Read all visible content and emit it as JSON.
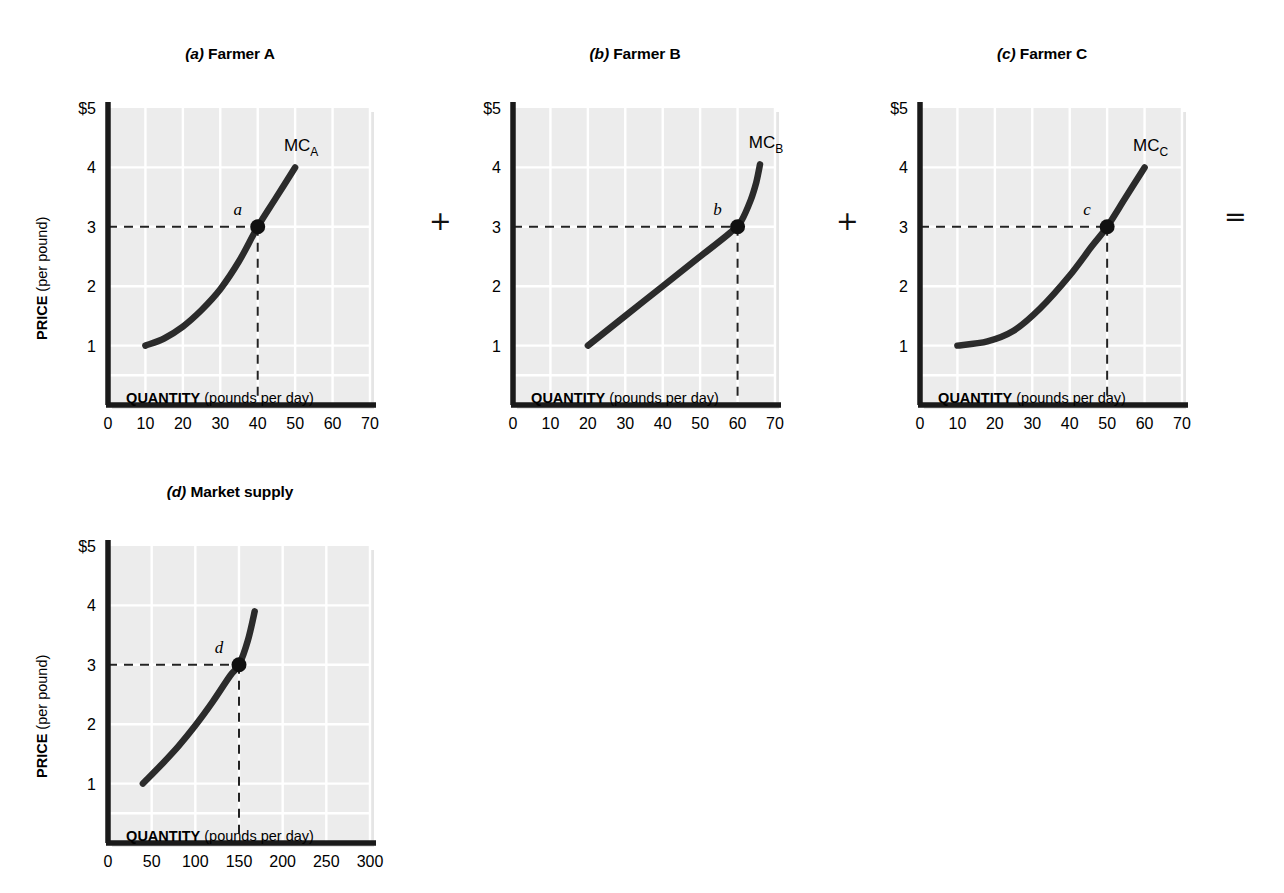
{
  "figure": {
    "background_color": "#ffffff",
    "plot_fill": "#ececec",
    "gridline_color": "#ffffff",
    "axis_color": "#1a1a1a",
    "curve_color": "#2b2b2b"
  },
  "connectors": [
    {
      "symbol": "+",
      "after_panel": "a"
    },
    {
      "symbol": "+",
      "after_panel": "b"
    },
    {
      "symbol": "=",
      "after_panel": "c"
    }
  ],
  "axis_titles": {
    "x_strong": "QUANTITY",
    "x_rest": " (pounds per day)",
    "y_strong": "PRICE",
    "y_rest": " (per pound)"
  },
  "panels": [
    {
      "id": "a",
      "tag": "(a)",
      "name": "Farmer A",
      "curve_label": "MC",
      "curve_label_sub": "A",
      "point_label": "a",
      "point": {
        "q": 40,
        "p": 3
      },
      "x_ticks": [
        0,
        10,
        20,
        30,
        40,
        50,
        60,
        70
      ],
      "y_ticks": [
        1,
        2,
        3,
        4,
        5
      ],
      "y_top_label": "$5",
      "xlim": [
        0,
        70
      ],
      "ylim": [
        0,
        5
      ],
      "curve_points": [
        [
          10,
          1.0
        ],
        [
          15,
          1.12
        ],
        [
          20,
          1.32
        ],
        [
          25,
          1.6
        ],
        [
          30,
          1.95
        ],
        [
          35,
          2.42
        ],
        [
          40,
          3.0
        ],
        [
          45,
          3.5
        ],
        [
          50,
          4.0
        ]
      ]
    },
    {
      "id": "b",
      "tag": "(b)",
      "name": "Farmer B",
      "curve_label": "MC",
      "curve_label_sub": "B",
      "point_label": "b",
      "point": {
        "q": 60,
        "p": 3
      },
      "x_ticks": [
        0,
        10,
        20,
        30,
        40,
        50,
        60,
        70
      ],
      "y_ticks": [
        1,
        2,
        3,
        4,
        5
      ],
      "y_top_label": "$5",
      "xlim": [
        0,
        70
      ],
      "ylim": [
        0,
        5
      ],
      "curve_points": [
        [
          20,
          1.0
        ],
        [
          30,
          1.5
        ],
        [
          40,
          2.0
        ],
        [
          50,
          2.5
        ],
        [
          58,
          2.9
        ],
        [
          61,
          3.1
        ],
        [
          63.5,
          3.45
        ],
        [
          65,
          3.75
        ],
        [
          66,
          4.05
        ]
      ]
    },
    {
      "id": "c",
      "tag": "(c)",
      "name": "Farmer C",
      "curve_label": "MC",
      "curve_label_sub": "C",
      "point_label": "c",
      "point": {
        "q": 50,
        "p": 3
      },
      "x_ticks": [
        0,
        10,
        20,
        30,
        40,
        50,
        60,
        70
      ],
      "y_ticks": [
        1,
        2,
        3,
        4,
        5
      ],
      "y_top_label": "$5",
      "xlim": [
        0,
        70
      ],
      "ylim": [
        0,
        5
      ],
      "curve_points": [
        [
          10,
          1.0
        ],
        [
          18,
          1.07
        ],
        [
          25,
          1.25
        ],
        [
          32,
          1.62
        ],
        [
          40,
          2.18
        ],
        [
          46,
          2.68
        ],
        [
          50,
          3.0
        ],
        [
          55,
          3.5
        ],
        [
          60,
          4.0
        ]
      ]
    },
    {
      "id": "d",
      "tag": "(d)",
      "name": "Market supply",
      "curve_label": "",
      "curve_label_sub": "",
      "point_label": "d",
      "point": {
        "q": 150,
        "p": 3
      },
      "x_ticks": [
        0,
        50,
        100,
        150,
        200,
        250,
        300
      ],
      "y_ticks": [
        1,
        2,
        3,
        4,
        5
      ],
      "y_top_label": "$5",
      "xlim": [
        0,
        300
      ],
      "ylim": [
        0,
        5
      ],
      "curve_points": [
        [
          40,
          1.0
        ],
        [
          60,
          1.3
        ],
        [
          80,
          1.62
        ],
        [
          100,
          1.98
        ],
        [
          120,
          2.38
        ],
        [
          140,
          2.82
        ],
        [
          150,
          3.0
        ],
        [
          160,
          3.4
        ],
        [
          168,
          3.9
        ]
      ]
    }
  ],
  "chart_data": [
    {
      "type": "line",
      "title": "(a) Farmer A",
      "xlabel": "QUANTITY (pounds per day)",
      "ylabel": "PRICE (per pound)",
      "xlim": [
        0,
        70
      ],
      "ylim": [
        0,
        5
      ],
      "xticks": [
        0,
        10,
        20,
        30,
        40,
        50,
        60,
        70
      ],
      "yticks": [
        1,
        2,
        3,
        4,
        5
      ],
      "grid": true,
      "legend": "none",
      "series": [
        {
          "name": "MC_A",
          "x": [
            10,
            15,
            20,
            25,
            30,
            35,
            40,
            45,
            50
          ],
          "values": [
            1.0,
            1.12,
            1.32,
            1.6,
            1.95,
            2.42,
            3.0,
            3.5,
            4.0
          ]
        }
      ],
      "annotations": [
        {
          "label": "a",
          "x": 40,
          "y": 3,
          "marker": "filled-circle"
        },
        {
          "label": "MC_A",
          "x": 50,
          "y": 4.35,
          "type": "curve-label"
        }
      ],
      "guides": [
        {
          "type": "horizontal-dashed",
          "y": 3,
          "from_x": 0,
          "to_x": 40
        },
        {
          "type": "vertical-dashed",
          "x": 40,
          "from_y": 0,
          "to_y": 3
        }
      ]
    },
    {
      "type": "line",
      "title": "(b) Farmer B",
      "xlabel": "QUANTITY (pounds per day)",
      "ylabel": "PRICE (per pound)",
      "xlim": [
        0,
        70
      ],
      "ylim": [
        0,
        5
      ],
      "xticks": [
        0,
        10,
        20,
        30,
        40,
        50,
        60,
        70
      ],
      "yticks": [
        1,
        2,
        3,
        4,
        5
      ],
      "grid": true,
      "legend": "none",
      "series": [
        {
          "name": "MC_B",
          "x": [
            20,
            30,
            40,
            50,
            58,
            61,
            63.5,
            65,
            66
          ],
          "values": [
            1.0,
            1.5,
            2.0,
            2.5,
            2.9,
            3.1,
            3.45,
            3.75,
            4.05
          ]
        }
      ],
      "annotations": [
        {
          "label": "b",
          "x": 60,
          "y": 3,
          "marker": "filled-circle"
        },
        {
          "label": "MC_B",
          "x": 64,
          "y": 4.4,
          "type": "curve-label"
        }
      ],
      "guides": [
        {
          "type": "horizontal-dashed",
          "y": 3,
          "from_x": 0,
          "to_x": 60
        },
        {
          "type": "vertical-dashed",
          "x": 60,
          "from_y": 0,
          "to_y": 3
        }
      ]
    },
    {
      "type": "line",
      "title": "(c) Farmer C",
      "xlabel": "QUANTITY (pounds per day)",
      "ylabel": "PRICE (per pound)",
      "xlim": [
        0,
        70
      ],
      "ylim": [
        0,
        5
      ],
      "xticks": [
        0,
        10,
        20,
        30,
        40,
        50,
        60,
        70
      ],
      "yticks": [
        1,
        2,
        3,
        4,
        5
      ],
      "grid": true,
      "legend": "none",
      "series": [
        {
          "name": "MC_C",
          "x": [
            10,
            18,
            25,
            32,
            40,
            46,
            50,
            55,
            60
          ],
          "values": [
            1.0,
            1.07,
            1.25,
            1.62,
            2.18,
            2.68,
            3.0,
            3.5,
            4.0
          ]
        }
      ],
      "annotations": [
        {
          "label": "c",
          "x": 50,
          "y": 3,
          "marker": "filled-circle"
        },
        {
          "label": "MC_C",
          "x": 58,
          "y": 4.35,
          "type": "curve-label"
        }
      ],
      "guides": [
        {
          "type": "horizontal-dashed",
          "y": 3,
          "from_x": 0,
          "to_x": 50
        },
        {
          "type": "vertical-dashed",
          "x": 50,
          "from_y": 0,
          "to_y": 3
        }
      ]
    },
    {
      "type": "line",
      "title": "(d) Market supply",
      "xlabel": "QUANTITY (pounds per day)",
      "ylabel": "PRICE (per pound)",
      "xlim": [
        0,
        300
      ],
      "ylim": [
        0,
        5
      ],
      "xticks": [
        0,
        50,
        100,
        150,
        200,
        250,
        300
      ],
      "yticks": [
        1,
        2,
        3,
        4,
        5
      ],
      "grid": true,
      "legend": "none",
      "series": [
        {
          "name": "Market supply",
          "x": [
            40,
            60,
            80,
            100,
            120,
            140,
            150,
            160,
            168
          ],
          "values": [
            1.0,
            1.3,
            1.62,
            1.98,
            2.38,
            2.82,
            3.0,
            3.4,
            3.9
          ]
        }
      ],
      "annotations": [
        {
          "label": "d",
          "x": 150,
          "y": 3,
          "marker": "filled-circle"
        }
      ],
      "guides": [
        {
          "type": "horizontal-dashed",
          "y": 3,
          "from_x": 0,
          "to_x": 150
        },
        {
          "type": "vertical-dashed",
          "x": 150,
          "from_y": 0,
          "to_y": 3
        }
      ]
    }
  ]
}
